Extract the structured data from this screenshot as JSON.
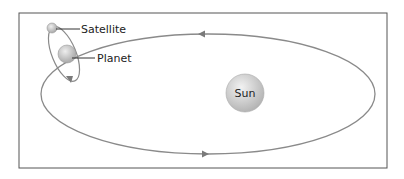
{
  "diagram": {
    "title": "",
    "labels": {
      "satellite": "Satellite",
      "planet": "Planet",
      "sun": "Sun"
    },
    "colors": {
      "frame": "#555555",
      "orbit": "#8a8a8a",
      "body_fill": "#d6d6d6",
      "text": "#222222"
    }
  }
}
